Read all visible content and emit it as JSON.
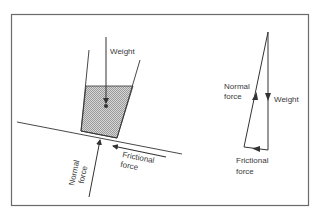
{
  "diagram": {
    "type": "free-body force diagram",
    "colors": {
      "background": "#ffffff",
      "frame": "#6a6a6a",
      "line": "#333333",
      "liquid_fill": "#c8c8c8",
      "text": "#3a3a3a"
    },
    "left_figure": {
      "description": "Container of liquid resting on an inclined surface",
      "labels": {
        "weight": "Weight",
        "normal_line1": "Normal",
        "normal_line2": "force",
        "friction_line1": "Frictional",
        "friction_line2": "force"
      }
    },
    "right_figure": {
      "description": "Triangle of forces",
      "labels": {
        "normal_line1": "Normal",
        "normal_line2": "force",
        "weight": "Weight",
        "friction_line1": "Frictional",
        "friction_line2": "force"
      }
    }
  }
}
